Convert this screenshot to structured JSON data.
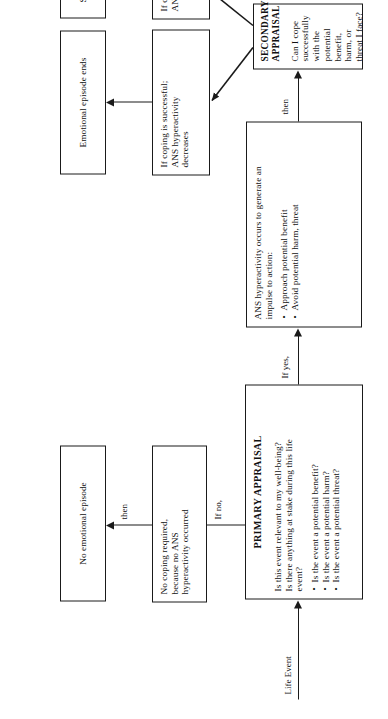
{
  "figure": {
    "type": "flowchart",
    "orientation": "rotated-90-ccw",
    "background_color": "#ffffff",
    "line_color": "#1a1a1a"
  },
  "entry": {
    "label": "Life Event"
  },
  "nodes": {
    "primary_appraisal": {
      "title": "PRIMARY APPRAISAL",
      "line1": "Is this event relevant to my well-being?",
      "line2": "Is there anything at stake during this life",
      "line3": "event?",
      "bullets": [
        "Is the event a potential benefit?",
        "Is the event a potential harm?",
        "Is the event a potential threat?"
      ]
    },
    "no_coping": {
      "line1": "No coping required,",
      "line2": "because no ANS",
      "line3": "hyperactivity occurred"
    },
    "no_episode": {
      "text": "No emotional episode"
    },
    "ans_hyperactivity": {
      "line1": "ANS hyperactivity occurs to generate an",
      "line2": "impulse to action:",
      "bullets": [
        "Approach potential benefit",
        "Avoid potential harm, threat"
      ]
    },
    "secondary_appraisal": {
      "title": "SECONDARY APPRAISAL",
      "line1": "Can I cope successfully with the",
      "line2": "potential benefit, harm, or threat I face?"
    },
    "coping_success": {
      "line1": "If coping is successful;",
      "line2": "ANS hyperactivity",
      "line3": "decreases"
    },
    "coping_failure": {
      "line1": "If coping is unsuccessful;",
      "line2": "ANS hyperactivity remains"
    },
    "episode_ends": {
      "text": "Emotional episode ends"
    },
    "stress_anxiety": {
      "text": "Stress, Anxiety"
    }
  },
  "edges": {
    "if_no": "If no,",
    "then_1": "then",
    "if_yes": "If yes,",
    "then_2": "then"
  }
}
